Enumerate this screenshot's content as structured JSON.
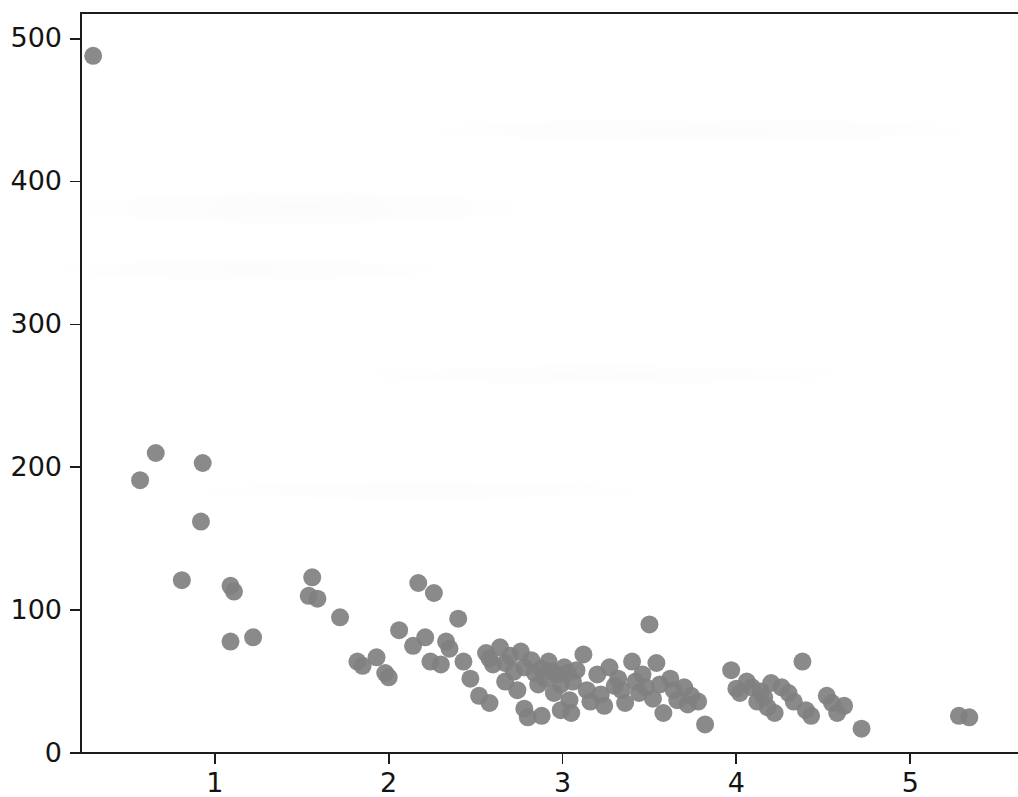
{
  "figure": {
    "title": "",
    "background_color": "#ffffff",
    "width": 1018,
    "height": 797
  },
  "axes": {
    "spine_color": "#1c1c1c",
    "tick_label_color": "#141414",
    "marker_color": "#808080",
    "marker_size_px": 18,
    "grid": "off",
    "legend": "none",
    "plot_left_px": 81,
    "plot_top_px": 13,
    "plot_bottom_px": 753,
    "x_tick_labels": [
      "1",
      "2",
      "3",
      "4",
      "5"
    ],
    "y_tick_labels": [
      "0",
      "100",
      "200",
      "300",
      "400",
      "500"
    ]
  },
  "chart_data": {
    "type": "scatter",
    "title": "",
    "xlabel": "",
    "ylabel": "",
    "xlim": [
      0.23,
      5.62
    ],
    "ylim": [
      0,
      518
    ],
    "xticks": [
      1,
      2,
      3,
      4,
      5
    ],
    "yticks": [
      0,
      100,
      200,
      300,
      400,
      500
    ],
    "grid": false,
    "legend": null,
    "marker": "circle",
    "marker_color": "#808080",
    "n_points": 120,
    "points": [
      [
        0.3,
        488
      ],
      [
        0.57,
        191
      ],
      [
        0.66,
        210
      ],
      [
        0.93,
        203
      ],
      [
        0.92,
        162
      ],
      [
        0.81,
        121
      ],
      [
        1.09,
        117
      ],
      [
        1.11,
        113
      ],
      [
        1.09,
        78
      ],
      [
        1.22,
        81
      ],
      [
        1.56,
        123
      ],
      [
        1.54,
        110
      ],
      [
        1.59,
        108
      ],
      [
        1.72,
        95
      ],
      [
        1.82,
        64
      ],
      [
        1.85,
        61
      ],
      [
        1.93,
        67
      ],
      [
        1.98,
        56
      ],
      [
        2.0,
        53
      ],
      [
        2.06,
        86
      ],
      [
        2.14,
        75
      ],
      [
        2.17,
        119
      ],
      [
        2.21,
        81
      ],
      [
        2.26,
        112
      ],
      [
        2.24,
        64
      ],
      [
        2.3,
        62
      ],
      [
        2.33,
        78
      ],
      [
        2.35,
        73
      ],
      [
        2.4,
        94
      ],
      [
        2.43,
        64
      ],
      [
        2.47,
        52
      ],
      [
        2.52,
        40
      ],
      [
        2.56,
        70
      ],
      [
        2.58,
        66
      ],
      [
        2.6,
        62
      ],
      [
        2.58,
        35
      ],
      [
        2.64,
        74
      ],
      [
        2.67,
        63
      ],
      [
        2.67,
        50
      ],
      [
        2.7,
        68
      ],
      [
        2.72,
        57
      ],
      [
        2.74,
        44
      ],
      [
        2.76,
        71
      ],
      [
        2.78,
        60
      ],
      [
        2.78,
        31
      ],
      [
        2.8,
        25
      ],
      [
        2.82,
        65
      ],
      [
        2.84,
        56
      ],
      [
        2.86,
        48
      ],
      [
        2.88,
        59
      ],
      [
        2.9,
        52
      ],
      [
        2.88,
        26
      ],
      [
        2.92,
        64
      ],
      [
        2.94,
        57
      ],
      [
        2.95,
        42
      ],
      [
        2.97,
        55
      ],
      [
        2.99,
        48
      ],
      [
        2.99,
        30
      ],
      [
        3.01,
        60
      ],
      [
        3.03,
        56
      ],
      [
        3.04,
        37
      ],
      [
        3.06,
        50
      ],
      [
        3.08,
        58
      ],
      [
        3.05,
        28
      ],
      [
        3.12,
        69
      ],
      [
        3.14,
        44
      ],
      [
        3.16,
        36
      ],
      [
        3.2,
        55
      ],
      [
        3.22,
        41
      ],
      [
        3.24,
        33
      ],
      [
        3.27,
        60
      ],
      [
        3.3,
        47
      ],
      [
        3.32,
        52
      ],
      [
        3.34,
        44
      ],
      [
        3.36,
        35
      ],
      [
        3.4,
        64
      ],
      [
        3.42,
        50
      ],
      [
        3.44,
        42
      ],
      [
        3.46,
        55
      ],
      [
        3.48,
        46
      ],
      [
        3.5,
        90
      ],
      [
        3.52,
        38
      ],
      [
        3.54,
        63
      ],
      [
        3.56,
        48
      ],
      [
        3.58,
        28
      ],
      [
        3.62,
        52
      ],
      [
        3.64,
        44
      ],
      [
        3.66,
        37
      ],
      [
        3.7,
        46
      ],
      [
        3.72,
        34
      ],
      [
        3.74,
        40
      ],
      [
        3.78,
        36
      ],
      [
        3.82,
        20
      ],
      [
        3.97,
        58
      ],
      [
        4.0,
        45
      ],
      [
        4.02,
        42
      ],
      [
        4.06,
        50
      ],
      [
        4.09,
        46
      ],
      [
        4.12,
        36
      ],
      [
        4.14,
        43
      ],
      [
        4.16,
        39
      ],
      [
        4.18,
        32
      ],
      [
        4.2,
        49
      ],
      [
        4.22,
        28
      ],
      [
        4.26,
        46
      ],
      [
        4.3,
        42
      ],
      [
        4.33,
        36
      ],
      [
        4.38,
        64
      ],
      [
        4.4,
        30
      ],
      [
        4.43,
        26
      ],
      [
        4.52,
        40
      ],
      [
        4.55,
        35
      ],
      [
        4.58,
        28
      ],
      [
        4.62,
        33
      ],
      [
        4.72,
        17
      ],
      [
        5.28,
        26
      ],
      [
        5.34,
        25
      ]
    ]
  }
}
